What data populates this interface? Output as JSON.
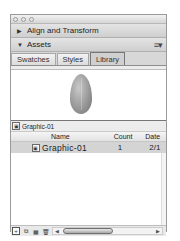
{
  "window": {
    "title_buttons": [
      "close",
      "minimize",
      "zoom"
    ]
  },
  "sections": [
    {
      "label": "Align and Transform",
      "state": "collapsed",
      "icon": "triangle-right-icon"
    },
    {
      "label": "Assets",
      "state": "expanded",
      "icon": "triangle-down-icon"
    }
  ],
  "assets": {
    "menu_icon": "panel-menu-icon",
    "tabs": [
      {
        "label": "Swatches",
        "active": false
      },
      {
        "label": "Styles",
        "active": false
      },
      {
        "label": "Library",
        "active": true
      }
    ],
    "preview": {
      "shape": "gray-egg-graphic"
    },
    "selected_item_name": "Graphic-01",
    "columns": {
      "name": "Name",
      "count": "Count",
      "date": "Date"
    },
    "rows": [
      {
        "name": "Graphic-01",
        "count": "1",
        "date": "2/1"
      }
    ],
    "footer_buttons": [
      "new-symbol-icon",
      "duplicate-icon",
      "properties-icon",
      "trash-icon"
    ]
  }
}
